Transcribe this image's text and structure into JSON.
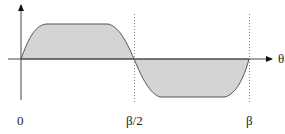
{
  "diagram": {
    "title": "",
    "axes": {
      "x_label": "θ",
      "ticks": [
        {
          "label": "0",
          "x": 21
        },
        {
          "label": "β/2",
          "x": 135
        },
        {
          "label": "β",
          "x": 250
        }
      ]
    },
    "waveform": {
      "description": "Trapezoidal-like wave: positive lobe from 0 to β/2, negative lobe from β/2 to β",
      "fill_color": "#d4d4d4",
      "stroke_color": "#555555"
    },
    "guide_lines": [
      {
        "at": "β/2",
        "style": "dotted"
      },
      {
        "at": "β",
        "style": "dotted"
      }
    ]
  }
}
